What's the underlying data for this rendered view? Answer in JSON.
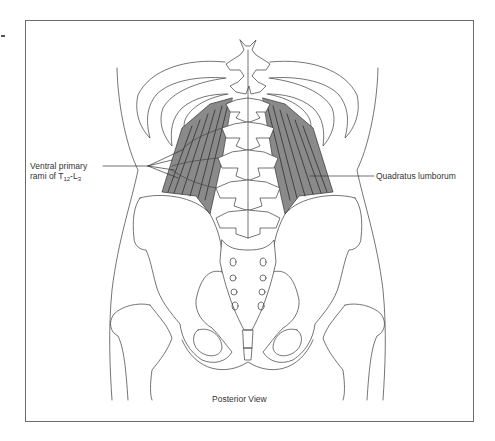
{
  "figure": {
    "view_caption": "Posterior View",
    "labels": {
      "rami_line1": "Ventral primary",
      "rami_line2_prefix": "rami of T",
      "rami_sub1": "12",
      "rami_dash": "-L",
      "rami_sub2": "3",
      "quadratus": "Quadratus lumborum"
    },
    "colors": {
      "muscle_fill": "#8a8a8a",
      "muscle_striation": "#333333",
      "bone_outline": "#3a3a3a",
      "frame": "#6b6b6b"
    }
  }
}
